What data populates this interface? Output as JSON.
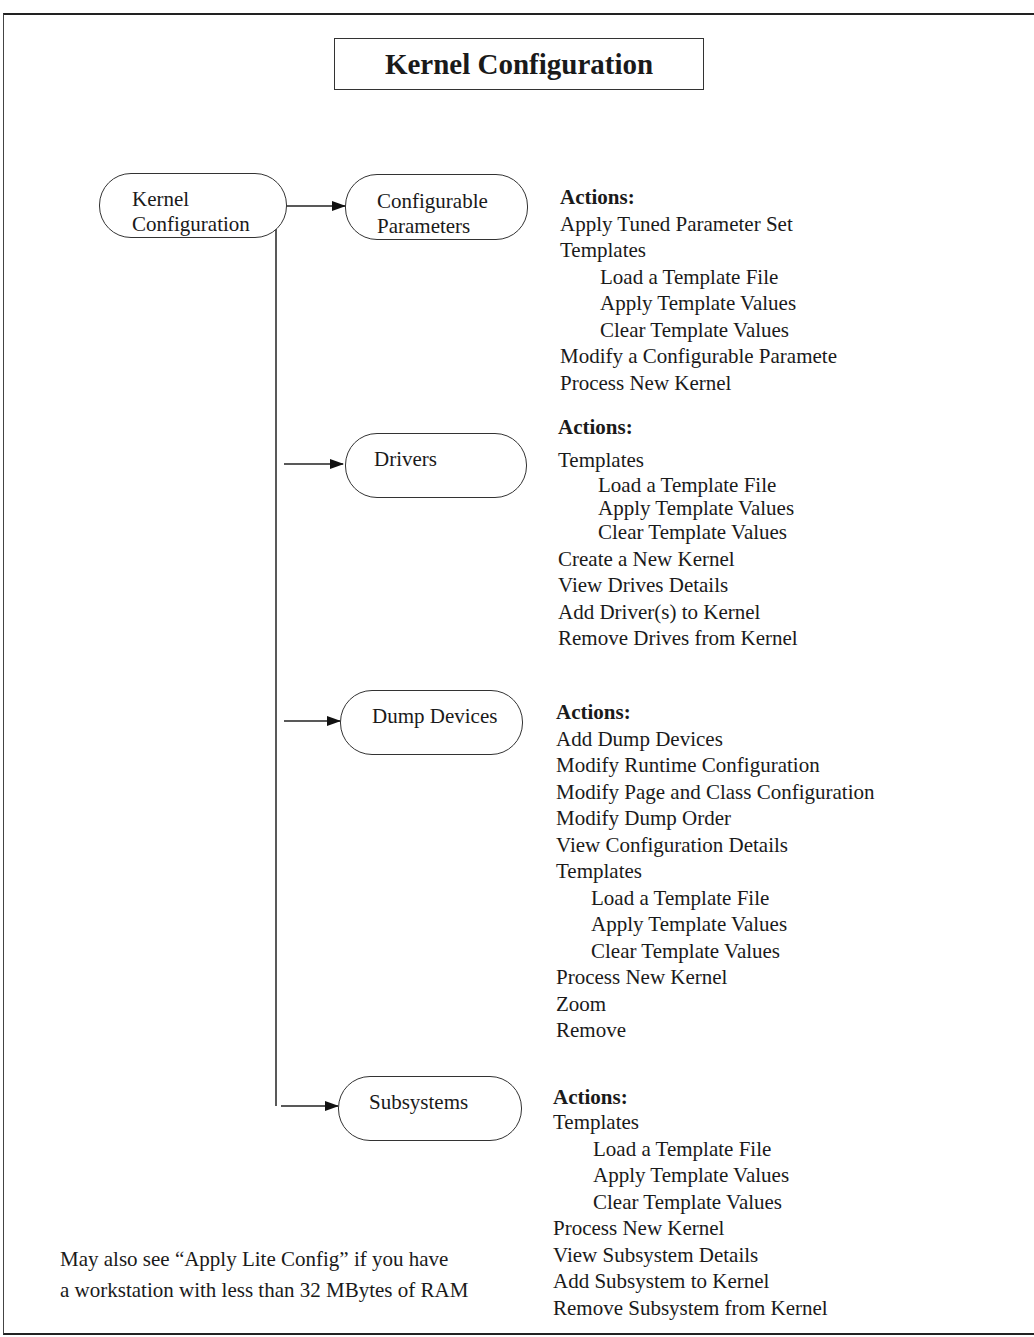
{
  "title": "Kernel Configuration",
  "root": {
    "line1": "Kernel",
    "line2": "Configuration"
  },
  "nodes": [
    {
      "line1": "Configurable",
      "line2": "Parameters"
    },
    {
      "line1": "Drivers"
    },
    {
      "line1": "Dump Devices"
    },
    {
      "line1": "Subsystems"
    }
  ],
  "actions_header": "Actions:",
  "action_groups": [
    {
      "items": [
        "Apply Tuned Parameter Set",
        "Templates",
        "Load a Template File",
        "Apply Template Values",
        "Clear Template Values",
        "Modify a Configurable Paramete",
        "Process New Kernel"
      ]
    },
    {
      "items": [
        "Templates",
        "Load a Template File",
        "Apply Template Values",
        "Clear Template Values",
        "Create a New Kernel",
        "View Drives Details",
        "Add Driver(s) to Kernel",
        "Remove Drives from Kernel"
      ]
    },
    {
      "items": [
        "Add Dump Devices",
        "Modify Runtime Configuration",
        "Modify Page and Class Configuration",
        "Modify Dump Order",
        "View Configuration Details",
        "Templates",
        "Load a Template File",
        "Apply Template Values",
        "Clear Template Values",
        "Process New Kernel",
        "Zoom",
        "Remove"
      ]
    },
    {
      "items": [
        "Templates",
        "Load a Template File",
        "Apply Template Values",
        "Clear Template Values",
        "Process New Kernel",
        "View Subsystem Details",
        "Add Subsystem to Kernel",
        "Remove Subsystem from Kernel"
      ]
    }
  ],
  "note": {
    "line1": "May also see “Apply Lite Config” if you have",
    "line2": "a workstation with less than 32 MBytes of RAM"
  }
}
